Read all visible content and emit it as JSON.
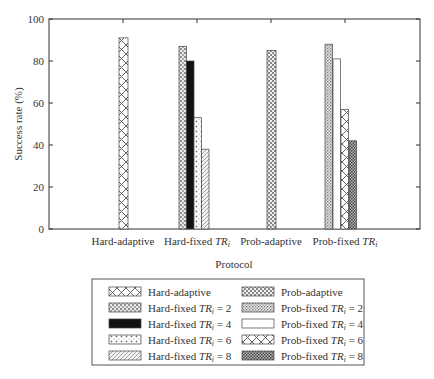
{
  "chart_data": {
    "type": "bar",
    "title": "",
    "xlabel": "Protocol",
    "ylabel": "Success rate (%)",
    "ylim": [
      0,
      100
    ],
    "yticks": [
      0,
      20,
      40,
      60,
      80,
      100
    ],
    "grid": false,
    "legend_position": "below",
    "categories": [
      "Hard-adaptive",
      "Hard-fixed TRi",
      "Prob-adaptive",
      "Prob-fixed TRi"
    ],
    "series": [
      {
        "name": "Hard-adaptive",
        "category": "Hard-adaptive",
        "value": 91,
        "pattern": "crosshatch"
      },
      {
        "name": "Hard-fixed TRi = 2",
        "category": "Hard-fixed TRi",
        "value": 87,
        "pattern": "dense-dots"
      },
      {
        "name": "Hard-fixed TRi = 4",
        "category": "Hard-fixed TRi",
        "value": 80,
        "pattern": "solid-black"
      },
      {
        "name": "Hard-fixed TRi = 6",
        "category": "Hard-fixed TRi",
        "value": 53,
        "pattern": "sparse-dots"
      },
      {
        "name": "Hard-fixed TRi = 8",
        "category": "Hard-fixed TRi",
        "value": 38,
        "pattern": "diagonal"
      },
      {
        "name": "Prob-adaptive",
        "category": "Prob-adaptive",
        "value": 85,
        "pattern": "checker"
      },
      {
        "name": "Prob-fixed TRi = 2",
        "category": "Prob-fixed TRi",
        "value": 88,
        "pattern": "fine-dots"
      },
      {
        "name": "Prob-fixed TRi = 4",
        "category": "Prob-fixed TRi",
        "value": 81,
        "pattern": "white"
      },
      {
        "name": "Prob-fixed TRi = 6",
        "category": "Prob-fixed TRi",
        "value": 57,
        "pattern": "crosshatch"
      },
      {
        "name": "Prob-fixed TRi = 8",
        "category": "Prob-fixed TRi",
        "value": 42,
        "pattern": "dark-checker"
      }
    ]
  },
  "axis": {
    "ylabel": "Success rate (%)",
    "xlabel": "Protocol",
    "yticks": [
      "0",
      "20",
      "40",
      "60",
      "80",
      "100"
    ],
    "categories": [
      {
        "main": "Hard-adaptive",
        "italic": ""
      },
      {
        "main": "Hard-fixed ",
        "italic": "TR"
      },
      {
        "main": "Prob-adaptive",
        "italic": ""
      },
      {
        "main": "Prob-fixed ",
        "italic": "TR"
      }
    ]
  },
  "legend": {
    "left": [
      {
        "prefix": "Hard-adaptive",
        "tr": "",
        "value": ""
      },
      {
        "prefix": "Hard-fixed ",
        "tr": "TR",
        "value": " = 2"
      },
      {
        "prefix": "Hard-fixed ",
        "tr": "TR",
        "value": " = 4"
      },
      {
        "prefix": "Hard-fixed ",
        "tr": "TR",
        "value": " = 6"
      },
      {
        "prefix": "Hard-fixed ",
        "tr": "TR",
        "value": " = 8"
      }
    ],
    "right": [
      {
        "prefix": "Prob-adaptive",
        "tr": "",
        "value": ""
      },
      {
        "prefix": "Prob-fixed ",
        "tr": "TR",
        "value": " = 2"
      },
      {
        "prefix": "Prob-fixed ",
        "tr": "TR",
        "value": " = 4"
      },
      {
        "prefix": "Prob-fixed ",
        "tr": "TR",
        "value": " = 6"
      },
      {
        "prefix": "Prob-fixed ",
        "tr": "TR",
        "value": " = 8"
      }
    ]
  }
}
